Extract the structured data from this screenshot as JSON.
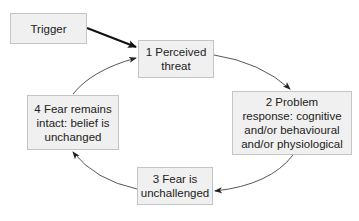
{
  "diagram": {
    "type": "cycle",
    "nodes": [
      {
        "id": "trigger",
        "label": "Trigger"
      },
      {
        "id": "n1",
        "label": "1 Perceived threat"
      },
      {
        "id": "n2",
        "label": "2 Problem response: cognitive and/or behavioural and/or physiological"
      },
      {
        "id": "n3",
        "label": "3 Fear is unchallenged"
      },
      {
        "id": "n4",
        "label": "4 Fear remains intact: belief is unchanged"
      }
    ],
    "edges": [
      {
        "from": "trigger",
        "to": "n1",
        "style": "bold straight"
      },
      {
        "from": "n1",
        "to": "n2",
        "style": "curved"
      },
      {
        "from": "n2",
        "to": "n3",
        "style": "curved"
      },
      {
        "from": "n3",
        "to": "n4",
        "style": "curved"
      },
      {
        "from": "n4",
        "to": "n1",
        "style": "curved"
      }
    ],
    "colors": {
      "box_fill": "#f0f0f0",
      "box_border": "#c4c4c4",
      "arrow": "#333333"
    }
  }
}
